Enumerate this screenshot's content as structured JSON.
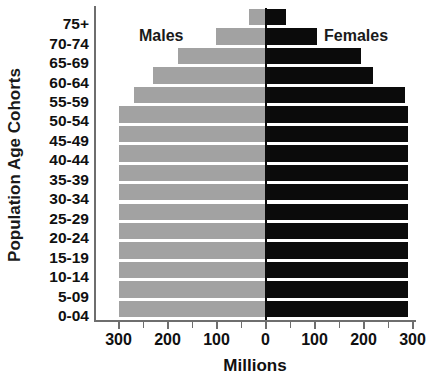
{
  "chart_data": {
    "type": "bar",
    "subtype": "population-pyramid",
    "title": "",
    "xlabel": "Millions",
    "ylabel": "Population Age Cohorts",
    "orientation": "horizontal",
    "grid": false,
    "legend_position": "inside-top",
    "categories": [
      "75+",
      "70-74",
      "65-69",
      "60-64",
      "55-59",
      "50-54",
      "45-49",
      "40-44",
      "35-39",
      "30-34",
      "25-29",
      "20-24",
      "15-19",
      "10-14",
      "5-09",
      "0-04"
    ],
    "axis_max": 300,
    "xlim": [
      -300,
      300
    ],
    "x_tick_labels": [
      "300",
      "200",
      "100",
      "0",
      "100",
      "200",
      "300"
    ],
    "x_tick_values": [
      -300,
      -200,
      -100,
      0,
      100,
      200,
      300
    ],
    "x_minor_tick_values": [
      -250,
      -150,
      -50,
      50,
      150,
      250
    ],
    "series": [
      {
        "name": "Males",
        "side": "left",
        "color": "#a2a2a2",
        "values": [
          33,
          102,
          178,
          229,
          269,
          298,
          298,
          298,
          298,
          298,
          298,
          298,
          298,
          298,
          298,
          298
        ]
      },
      {
        "name": "Females",
        "side": "right",
        "color": "#0b0b0b",
        "values": [
          41,
          106,
          194,
          220,
          284,
          290,
          290,
          290,
          290,
          290,
          290,
          290,
          290,
          290,
          290,
          290
        ]
      }
    ]
  },
  "labels": {
    "males": "Males",
    "females": "Females",
    "x_axis_title": "Millions",
    "y_axis_title": "Population Age Cohorts"
  }
}
